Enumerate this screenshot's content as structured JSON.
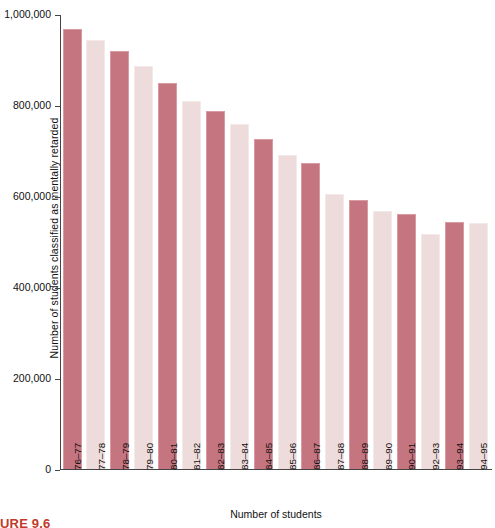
{
  "chart_data": {
    "type": "bar",
    "title": "",
    "xlabel": "Number of students",
    "ylabel": "Number of students classified as mentally retarded",
    "ylim": [
      0,
      1000000
    ],
    "grid": false,
    "legend": "none",
    "ytick_labels": [
      "1,000,000",
      "800,000",
      "600,000",
      "400,000",
      "200,000",
      "0"
    ],
    "ytick_values": [
      1000000,
      800000,
      600000,
      400000,
      200000,
      0
    ],
    "categories": [
      "76–77",
      "77–78",
      "78–79",
      "79–80",
      "80–81",
      "81–82",
      "82–83",
      "83–84",
      "84–85",
      "85–86",
      "86–87",
      "87–88",
      "88–89",
      "89–90",
      "90–91",
      "92–93",
      "93–94",
      "94–95"
    ],
    "values": [
      969000,
      946000,
      921000,
      888000,
      850000,
      810000,
      788000,
      760000,
      726000,
      692000,
      673000,
      606000,
      592000,
      568000,
      562000,
      518000,
      544000,
      541000
    ],
    "bar_colors": [
      "dark",
      "light",
      "dark",
      "light",
      "dark",
      "light",
      "dark",
      "light",
      "dark",
      "light",
      "dark",
      "light",
      "dark",
      "light",
      "dark",
      "light",
      "dark",
      "light"
    ],
    "color_dark": "#c4757f",
    "color_light": "#eedcdd"
  },
  "caption": {
    "text": "URE 9.6"
  }
}
